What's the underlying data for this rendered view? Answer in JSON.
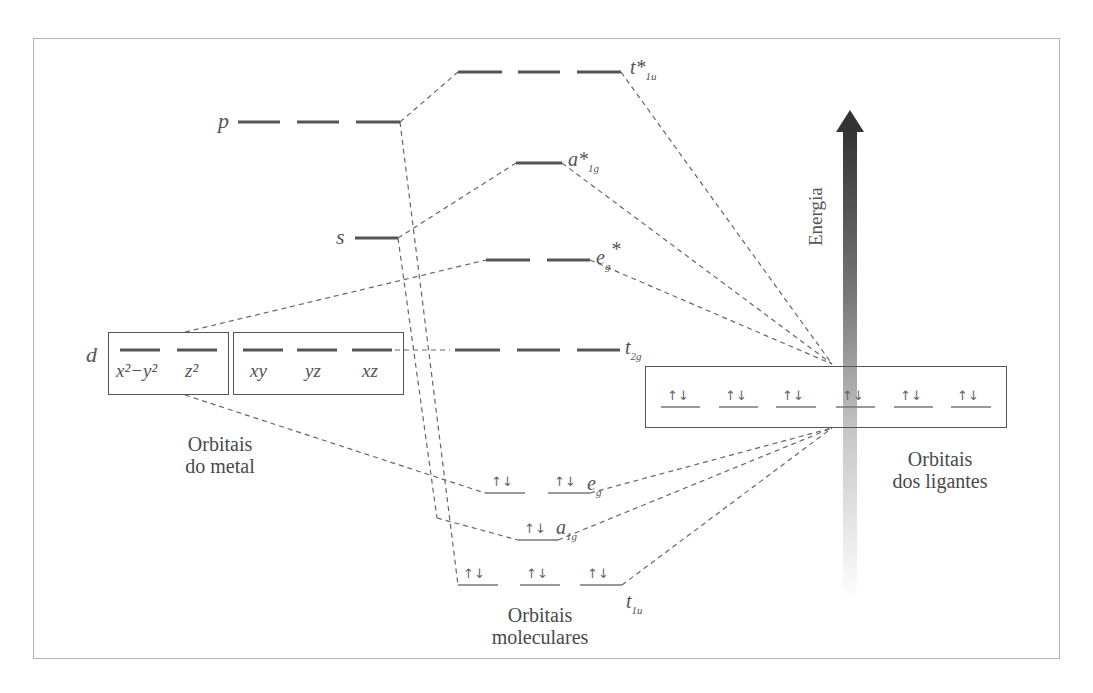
{
  "figure": {
    "type": "molecular orbital energy diagram (octahedral complex, sigma bonding)",
    "energy_axis_label": "Energia",
    "captions": {
      "metal": [
        "Orbitais",
        "do metal"
      ],
      "ligands": [
        "Orbitais",
        "dos ligantes"
      ],
      "molecular": [
        "Orbitais",
        "moleculares"
      ]
    },
    "metal_orbitals": {
      "p": {
        "label": "p",
        "degeneracy": 3
      },
      "s": {
        "label": "s",
        "degeneracy": 1
      },
      "d": {
        "label": "d",
        "eg_set": [
          "x²−y²",
          "z²"
        ],
        "t2g_set": [
          "xy",
          "yz",
          "xz"
        ]
      }
    },
    "molecular_orbitals": [
      {
        "id": "t1u_star",
        "label": "t*",
        "subscript": "1u",
        "degeneracy": 3,
        "electrons": 0
      },
      {
        "id": "a1g_star",
        "label": "a*",
        "subscript": "1g",
        "degeneracy": 1,
        "electrons": 0
      },
      {
        "id": "eg_star",
        "label": "e",
        "subscript": "g",
        "superscript": "*",
        "degeneracy": 2,
        "electrons": 0
      },
      {
        "id": "t2g",
        "label": "t",
        "subscript": "2g",
        "degeneracy": 3,
        "electrons": 0
      },
      {
        "id": "eg",
        "label": "e",
        "subscript": "g",
        "degeneracy": 2,
        "electrons": 4
      },
      {
        "id": "a1g",
        "label": "a",
        "subscript": "1g",
        "degeneracy": 1,
        "electrons": 2
      },
      {
        "id": "t1u",
        "label": "t",
        "subscript": "1u",
        "degeneracy": 3,
        "electrons": 6
      }
    ],
    "ligand_orbitals": {
      "count": 6,
      "electrons_each": 2,
      "pair_symbol": "↿⇂"
    },
    "electron_pair": "↑↓"
  }
}
